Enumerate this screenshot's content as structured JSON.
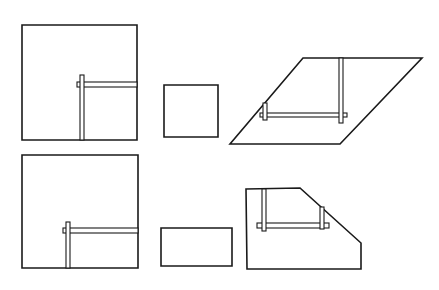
{
  "diagram": {
    "stroke_color": "#1a1a1a",
    "background": "#ffffff",
    "figures": [
      {
        "id": "top-left-square-with-tool",
        "shape": "polygon",
        "points": "22,25 137,25 137,140 22,140",
        "bars": [
          {
            "x": 77,
            "y": 82,
            "w": 60,
            "h": 5
          },
          {
            "x": 80,
            "y": 75,
            "w": 4,
            "h": 65
          }
        ]
      },
      {
        "id": "top-middle-small-square",
        "shape": "polygon",
        "points": "164,85 218,85 218,137 164,137",
        "bars": []
      },
      {
        "id": "top-right-parallelogram-with-tool",
        "shape": "polygon",
        "points": "303,58 422,58 340,144 230,144",
        "bars": [
          {
            "x": 260,
            "y": 113,
            "w": 87,
            "h": 4
          },
          {
            "x": 339,
            "y": 58,
            "w": 4,
            "h": 65
          },
          {
            "x": 263,
            "y": 103,
            "w": 4,
            "h": 17
          }
        ]
      },
      {
        "id": "bottom-left-square-with-tool",
        "shape": "polygon",
        "points": "22,155 138,155 138,268 22,268",
        "bars": [
          {
            "x": 63,
            "y": 228,
            "w": 75,
            "h": 5
          },
          {
            "x": 66,
            "y": 222,
            "w": 4,
            "h": 46
          }
        ]
      },
      {
        "id": "bottom-middle-small-rectangle",
        "shape": "polygon",
        "points": "161,228 232,228 232,266 161,266",
        "bars": []
      },
      {
        "id": "bottom-right-pentagon-with-tool",
        "shape": "polygon",
        "points": "246,189 300,188 361,243 361,269 247,269",
        "bars": [
          {
            "x": 257,
            "y": 223,
            "w": 72,
            "h": 5
          },
          {
            "x": 262,
            "y": 189,
            "w": 4,
            "h": 42
          },
          {
            "x": 320,
            "y": 207,
            "w": 4,
            "h": 22
          }
        ]
      }
    ]
  }
}
